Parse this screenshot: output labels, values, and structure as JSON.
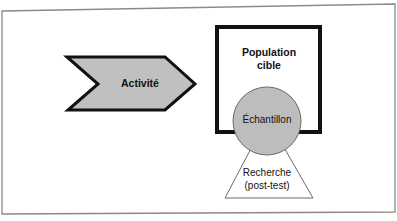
{
  "diagram": {
    "colors": {
      "frame": "#8a8a8a",
      "stroke": "#111111",
      "chevron_fill": "#c0c0c0",
      "circle_fill": "#bdbdbd",
      "triangle_fill": "#ffffff",
      "text": "#111111"
    },
    "activity": {
      "label": "Activité",
      "shape": "chevron-arrow"
    },
    "target_population": {
      "line1": "Population",
      "line2": "cible",
      "shape": "square"
    },
    "sample": {
      "label": "Échantillon",
      "shape": "circle"
    },
    "research": {
      "line1": "Recherche",
      "line2": "(post-test)",
      "shape": "triangle"
    }
  }
}
